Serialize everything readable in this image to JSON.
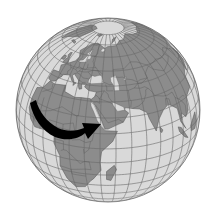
{
  "map": {
    "type": "orthographic-globe",
    "view_center": {
      "lon": 45,
      "lat": 25
    },
    "regions_visible": [
      "Europe",
      "Africa",
      "Middle East",
      "Arabian Peninsula",
      "Russia",
      "Central Asia",
      "India",
      "Southeast Asia",
      "Indian Ocean",
      "Madagascar",
      "Greenland",
      "Arctic"
    ],
    "colors": {
      "background": "#ffffff",
      "ocean": "#d9d9d9",
      "land": "#8c8c8c",
      "graticule": "#6a6a6a",
      "borders": "#555555",
      "arrow": "#000000",
      "ice": "#d4d4d4"
    },
    "graticule_step_deg": 10,
    "annotation": {
      "name": "migration-arrow",
      "from": "West Africa",
      "to": "Arabian Peninsula",
      "description": "Black curved arrow sweeping from northwest Africa across the Sahara toward the Red Sea / Arabia"
    },
    "globe": {
      "cx": 108,
      "cy": 110,
      "r": 92
    }
  }
}
